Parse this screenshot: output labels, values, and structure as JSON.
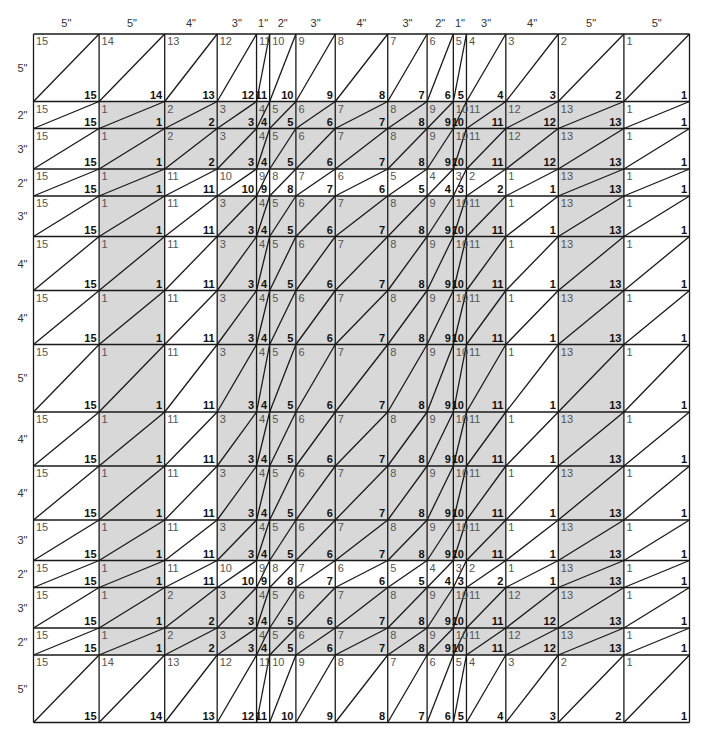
{
  "diagram": {
    "grid": {
      "left": 33.5,
      "top": 34,
      "unit_x": 13.12,
      "unit_y": 13.5
    },
    "colors": {
      "shade": "#d8d8d8",
      "line": "#1a1a1a",
      "background": "#ffffff"
    },
    "columns": [
      {
        "label": "5\"",
        "units": 5
      },
      {
        "label": "5\"",
        "units": 5
      },
      {
        "label": "4\"",
        "units": 4
      },
      {
        "label": "3\"",
        "units": 3
      },
      {
        "label": "1\"",
        "units": 1
      },
      {
        "label": "2\"",
        "units": 2
      },
      {
        "label": "3\"",
        "units": 3
      },
      {
        "label": "4\"",
        "units": 4
      },
      {
        "label": "3\"",
        "units": 3
      },
      {
        "label": "2\"",
        "units": 2
      },
      {
        "label": "1\"",
        "units": 1
      },
      {
        "label": "3\"",
        "units": 3
      },
      {
        "label": "4\"",
        "units": 4
      },
      {
        "label": "5\"",
        "units": 5
      },
      {
        "label": "5\"",
        "units": 5
      }
    ],
    "rows": [
      {
        "label": "5\"",
        "units": 5,
        "numbers": [
          15,
          14,
          13,
          12,
          11,
          10,
          9,
          8,
          7,
          6,
          5,
          4,
          3,
          2,
          1
        ],
        "shaded": [
          0,
          0,
          0,
          0,
          0,
          0,
          0,
          0,
          0,
          0,
          0,
          0,
          0,
          0,
          0
        ]
      },
      {
        "label": "2\"",
        "units": 2,
        "numbers": [
          15,
          1,
          2,
          3,
          4,
          5,
          6,
          7,
          8,
          9,
          10,
          11,
          12,
          13,
          1
        ],
        "shaded": [
          0,
          1,
          1,
          1,
          1,
          1,
          1,
          1,
          1,
          1,
          1,
          1,
          1,
          1,
          0
        ]
      },
      {
        "label": "3\"",
        "units": 3,
        "numbers": [
          15,
          1,
          2,
          3,
          4,
          5,
          6,
          7,
          8,
          9,
          10,
          11,
          12,
          13,
          1
        ],
        "shaded": [
          0,
          1,
          1,
          1,
          1,
          1,
          1,
          1,
          1,
          1,
          1,
          1,
          1,
          1,
          0
        ]
      },
      {
        "label": "2\"",
        "units": 2,
        "numbers": [
          15,
          1,
          11,
          10,
          9,
          8,
          7,
          6,
          5,
          4,
          3,
          2,
          1,
          13,
          1
        ],
        "shaded": [
          0,
          1,
          0,
          0,
          0,
          0,
          0,
          0,
          0,
          0,
          0,
          0,
          0,
          1,
          0
        ]
      },
      {
        "label": "3\"",
        "units": 3,
        "numbers": [
          15,
          1,
          11,
          3,
          4,
          5,
          6,
          7,
          8,
          9,
          10,
          11,
          1,
          13,
          1
        ],
        "shaded": [
          0,
          1,
          0,
          1,
          1,
          1,
          1,
          1,
          1,
          1,
          1,
          1,
          0,
          1,
          0
        ]
      },
      {
        "label": "4\"",
        "units": 4,
        "numbers": [
          15,
          1,
          11,
          3,
          4,
          5,
          6,
          7,
          8,
          9,
          10,
          11,
          1,
          13,
          1
        ],
        "shaded": [
          0,
          1,
          0,
          1,
          1,
          1,
          1,
          1,
          1,
          1,
          1,
          1,
          0,
          1,
          0
        ]
      },
      {
        "label": "4\"",
        "units": 4,
        "numbers": [
          15,
          1,
          11,
          3,
          4,
          5,
          6,
          7,
          8,
          9,
          10,
          11,
          1,
          13,
          1
        ],
        "shaded": [
          0,
          1,
          0,
          1,
          1,
          1,
          1,
          1,
          1,
          1,
          1,
          1,
          0,
          1,
          0
        ]
      },
      {
        "label": "5\"",
        "units": 5,
        "numbers": [
          15,
          1,
          11,
          3,
          4,
          5,
          6,
          7,
          8,
          9,
          10,
          11,
          1,
          13,
          1
        ],
        "shaded": [
          0,
          1,
          0,
          1,
          1,
          1,
          1,
          1,
          1,
          1,
          1,
          1,
          0,
          1,
          0
        ]
      },
      {
        "label": "4\"",
        "units": 4,
        "numbers": [
          15,
          1,
          11,
          3,
          4,
          5,
          6,
          7,
          8,
          9,
          10,
          11,
          1,
          13,
          1
        ],
        "shaded": [
          0,
          1,
          0,
          1,
          1,
          1,
          1,
          1,
          1,
          1,
          1,
          1,
          0,
          1,
          0
        ]
      },
      {
        "label": "4\"",
        "units": 4,
        "numbers": [
          15,
          1,
          11,
          3,
          4,
          5,
          6,
          7,
          8,
          9,
          10,
          11,
          1,
          13,
          1
        ],
        "shaded": [
          0,
          1,
          0,
          1,
          1,
          1,
          1,
          1,
          1,
          1,
          1,
          1,
          0,
          1,
          0
        ]
      },
      {
        "label": "3\"",
        "units": 3,
        "numbers": [
          15,
          1,
          11,
          3,
          4,
          5,
          6,
          7,
          8,
          9,
          10,
          11,
          1,
          13,
          1
        ],
        "shaded": [
          0,
          1,
          0,
          1,
          1,
          1,
          1,
          1,
          1,
          1,
          1,
          1,
          0,
          1,
          0
        ]
      },
      {
        "label": "2\"",
        "units": 2,
        "numbers": [
          15,
          1,
          11,
          10,
          9,
          8,
          7,
          6,
          5,
          4,
          3,
          2,
          1,
          13,
          1
        ],
        "shaded": [
          0,
          1,
          0,
          0,
          0,
          0,
          0,
          0,
          0,
          0,
          0,
          0,
          0,
          1,
          0
        ]
      },
      {
        "label": "3\"",
        "units": 3,
        "numbers": [
          15,
          1,
          2,
          3,
          4,
          5,
          6,
          7,
          8,
          9,
          10,
          11,
          12,
          13,
          1
        ],
        "shaded": [
          0,
          1,
          1,
          1,
          1,
          1,
          1,
          1,
          1,
          1,
          1,
          1,
          1,
          1,
          0
        ]
      },
      {
        "label": "2\"",
        "units": 2,
        "numbers": [
          15,
          1,
          2,
          3,
          4,
          5,
          6,
          7,
          8,
          9,
          10,
          11,
          12,
          13,
          1
        ],
        "shaded": [
          0,
          1,
          1,
          1,
          1,
          1,
          1,
          1,
          1,
          1,
          1,
          1,
          1,
          1,
          0
        ]
      },
      {
        "label": "5\"",
        "units": 5,
        "numbers": [
          15,
          14,
          13,
          12,
          11,
          10,
          9,
          8,
          7,
          6,
          5,
          4,
          3,
          2,
          1
        ],
        "shaded": [
          0,
          0,
          0,
          0,
          0,
          0,
          0,
          0,
          0,
          0,
          0,
          0,
          0,
          0,
          0
        ]
      }
    ]
  }
}
